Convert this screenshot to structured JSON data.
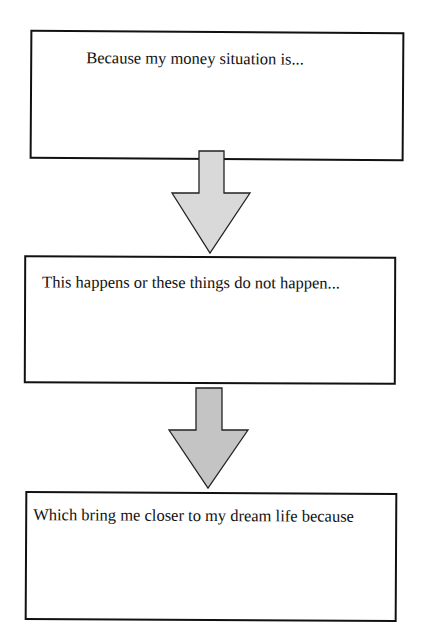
{
  "diagram": {
    "type": "vertical-flowchart",
    "boxes": [
      {
        "id": "box1",
        "label": "Because my money situation is..."
      },
      {
        "id": "box2",
        "label": "This happens or these things do not happen..."
      },
      {
        "id": "box3",
        "label": "Which bring me closer to my dream life because"
      }
    ],
    "arrows": [
      {
        "from": "box1",
        "to": "box2",
        "fill": "#d9d9d9",
        "stroke": "#222222"
      },
      {
        "from": "box2",
        "to": "box3",
        "fill": "#c4c4c4",
        "stroke": "#222222"
      }
    ]
  },
  "colors": {
    "background": "#ffffff",
    "border": "#111111",
    "text": "#111111"
  }
}
